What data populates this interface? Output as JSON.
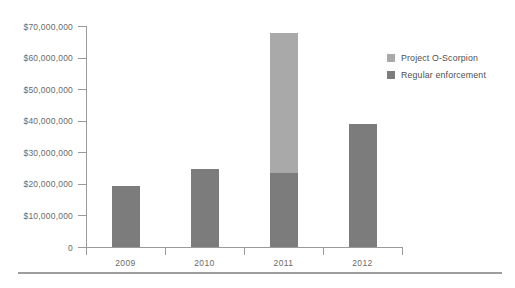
{
  "chart_data": {
    "type": "bar",
    "stacked": true,
    "title": "",
    "subtitle": "",
    "xlabel": "",
    "ylabel": "",
    "categories": [
      "2009",
      "2010",
      "2011",
      "2012"
    ],
    "series": [
      {
        "name": "Regular enforcement",
        "color": "#7c7c7c",
        "values": [
          19300000,
          24700000,
          23600000,
          38900000
        ]
      },
      {
        "name": "Project O-Scorpion",
        "color": "#a9a9a9",
        "values": [
          0,
          0,
          44300000,
          0
        ]
      }
    ],
    "totals": [
      19300000,
      24700000,
      67900000,
      38900000
    ],
    "ylim": [
      0,
      70000000
    ],
    "ytick_values": [
      0,
      10000000,
      20000000,
      30000000,
      40000000,
      50000000,
      60000000,
      70000000
    ],
    "ytick_labels": [
      "0",
      "$10,000,000",
      "$20,000,000",
      "$30,000,000",
      "$40,000,000",
      "$50,000,000",
      "$60,000,000",
      "$70,000,000"
    ],
    "grid": false,
    "legend_position": "top-right",
    "axis_color": "#9a9a9a",
    "text_color": "#6a6a6a"
  },
  "legend": {
    "items": [
      {
        "label": "Project O-Scorpion",
        "color": "#a9a9a9"
      },
      {
        "label": "Regular enforcement",
        "color": "#7c7c7c"
      }
    ]
  }
}
